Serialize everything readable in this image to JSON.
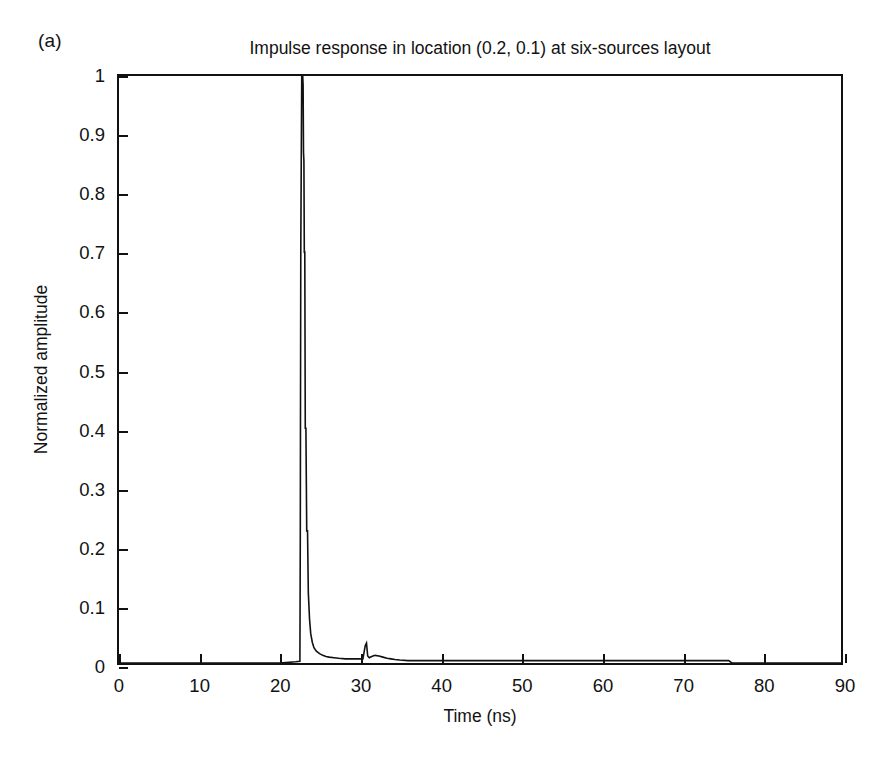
{
  "panel": {
    "label": "(a)"
  },
  "axis_titles": {
    "x": "Time (ns)",
    "y": "Normalized amplitude"
  },
  "chart_data": {
    "type": "line",
    "title": "Impulse response in location (0.2, 0.1) at six-sources layout",
    "xlabel": "Time (ns)",
    "ylabel": "Normalized amplitude",
    "xlim": [
      0,
      90
    ],
    "ylim": [
      0,
      1
    ],
    "grid": false,
    "legend": null,
    "xticks": [
      0,
      10,
      20,
      30,
      40,
      50,
      60,
      70,
      80,
      90
    ],
    "xtick_labels": [
      "0",
      "10",
      "20",
      "30",
      "40",
      "50",
      "60",
      "70",
      "80",
      "90"
    ],
    "yticks": [
      0,
      0.1,
      0.2,
      0.3,
      0.4,
      0.5,
      0.6,
      0.7,
      0.8,
      0.9,
      1
    ],
    "ytick_labels": [
      "0",
      "0.1",
      "0.2",
      "0.3",
      "0.4",
      "0.5",
      "0.6",
      "0.7",
      "0.8",
      "0.9",
      "1"
    ],
    "line_color": "#111111",
    "series": [
      {
        "name": "impulse response",
        "x": [
          0,
          5,
          10,
          15,
          20,
          22.0,
          22.55,
          22.6,
          22.62,
          22.66,
          22.72,
          22.78,
          22.84,
          22.9,
          22.95,
          23.0,
          23.05,
          23.1,
          23.16,
          23.22,
          23.3,
          23.4,
          23.5,
          23.6,
          23.75,
          23.9,
          24.1,
          24.3,
          24.6,
          25.0,
          25.4,
          25.8,
          26.2,
          26.8,
          27.4,
          28.2,
          29.0,
          29.8,
          30.4,
          30.7,
          30.85,
          31.0,
          31.2,
          31.5,
          31.9,
          32.4,
          32.9,
          33.4,
          33.9,
          34.4,
          35.0,
          36.0,
          38.0,
          42.0,
          48.0,
          55.0,
          62.0,
          68.0,
          72.0,
          75.0,
          76.0,
          76.4,
          78.0,
          82.0,
          86.0,
          90.0
        ],
        "y": [
          0,
          0,
          0,
          0,
          0,
          0.002,
          0.003,
          0.22,
          0.4,
          0.7,
          0.855,
          1.0,
          1.0,
          1.0,
          0.985,
          0.87,
          0.855,
          0.7,
          0.7,
          0.4,
          0.4,
          0.225,
          0.225,
          0.12,
          0.075,
          0.05,
          0.035,
          0.026,
          0.02,
          0.016,
          0.013,
          0.011,
          0.01,
          0.009,
          0.008,
          0.007,
          0.007,
          0.007,
          0.007,
          0.03,
          0.034,
          0.012,
          0.009,
          0.011,
          0.013,
          0.012,
          0.01,
          0.008,
          0.007,
          0.006,
          0.005,
          0.004,
          0.004,
          0.004,
          0.004,
          0.004,
          0.004,
          0.004,
          0.004,
          0.004,
          0.004,
          0.0,
          0.0,
          0.0,
          0.0,
          0.0
        ]
      }
    ],
    "annotations": [
      {
        "text": "main impulse arrival",
        "x": 22.8,
        "y": 1.0
      },
      {
        "text": "secondary reflection",
        "x": 30.7,
        "y": 0.03
      }
    ]
  }
}
